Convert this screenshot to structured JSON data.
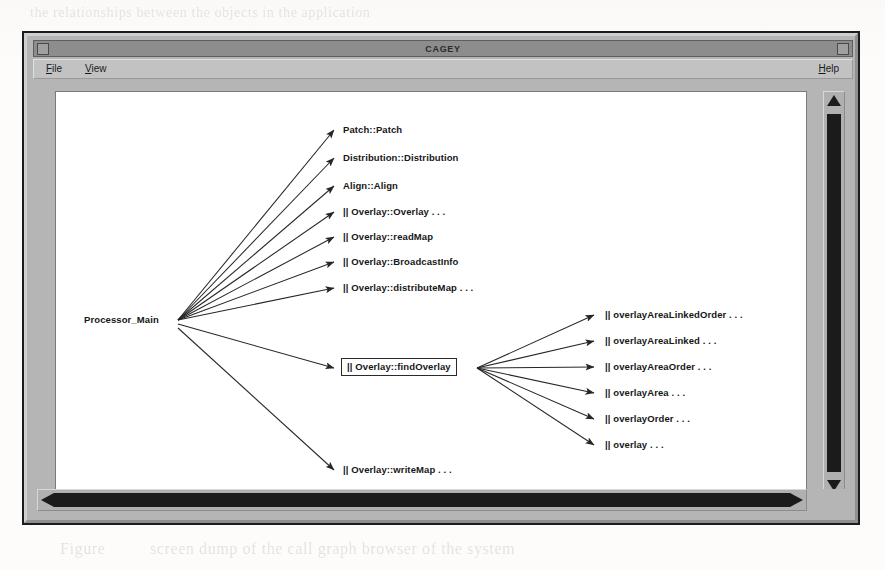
{
  "window": {
    "title": "CAGEY",
    "titlebar_left_button": "window-menu-button",
    "titlebar_right_button": "window-resize-button"
  },
  "menubar": {
    "items": [
      {
        "label": "File",
        "mnemonic": "F",
        "rest": "ile"
      },
      {
        "label": "View",
        "mnemonic": "V",
        "rest": "iew"
      },
      {
        "label": "Help",
        "mnemonic": "H",
        "rest": "elp"
      }
    ]
  },
  "graph": {
    "root": {
      "label": "Processor_Main",
      "x": 86,
      "y": 282,
      "boxed": false
    },
    "branch": {
      "label": "|| Overlay::findOverlay",
      "x": 345,
      "y": 363,
      "boxed": true
    },
    "level1": [
      {
        "label": "Patch::Patch",
        "x": 345,
        "y": 125
      },
      {
        "label": "Distribution::Distribution",
        "x": 345,
        "y": 153
      },
      {
        "label": "Align::Align",
        "x": 345,
        "y": 181
      },
      {
        "label": "|| Overlay::Overlay  . . .",
        "x": 345,
        "y": 207
      },
      {
        "label": "|| Overlay::readMap",
        "x": 345,
        "y": 232
      },
      {
        "label": "|| Overlay::BroadcastInfo",
        "x": 345,
        "y": 257
      },
      {
        "label": "|| Overlay::distributeMap  . . .",
        "x": 345,
        "y": 283
      },
      {
        "label": "|| Overlay::writeMap  . . .",
        "x": 345,
        "y": 465
      }
    ],
    "level2": [
      {
        "label": "|| overlayAreaLinkedOrder  . . .",
        "x": 608,
        "y": 310
      },
      {
        "label": "|| overlayAreaLinked  . . .",
        "x": 608,
        "y": 336
      },
      {
        "label": "|| overlayAreaOrder  . . .",
        "x": 608,
        "y": 362
      },
      {
        "label": "|| overlayArea  . . .",
        "x": 608,
        "y": 388
      },
      {
        "label": "|| overlayOrder  . . .",
        "x": 608,
        "y": 414
      },
      {
        "label": "|| overlay  . . .",
        "x": 608,
        "y": 440
      }
    ]
  },
  "scrollbars": {
    "vertical": {
      "name": "vertical-scrollbar",
      "thumb_position_pct": 5,
      "thumb_size_pct": 88
    },
    "horizontal": {
      "name": "horizontal-scrollbar",
      "thumb_position_pct": 0,
      "thumb_size_pct": 96
    }
  },
  "colors": {
    "window_face": "#b5b5b5",
    "titlebar": "#8d8d8d",
    "canvas": "#ffffff",
    "ink": "#171717",
    "scroll_thumb": "#1b1b1b"
  },
  "background_text": [
    {
      "t": "ode   hierarchy   and   the",
      "x": 92,
      "y": 122
    },
    {
      "t": "the   classes   in   the   tool",
      "x": 92,
      "y": 152
    },
    {
      "t": "a   result   the   source   code",
      "x": 92,
      "y": 182
    },
    {
      "t": "more   than   the   browser",
      "x": 92,
      "y": 212
    },
    {
      "t": "a   system   that",
      "x": 420,
      "y": 258
    },
    {
      "t": "the   graph   of   calls",
      "x": 120,
      "y": 462
    }
  ]
}
